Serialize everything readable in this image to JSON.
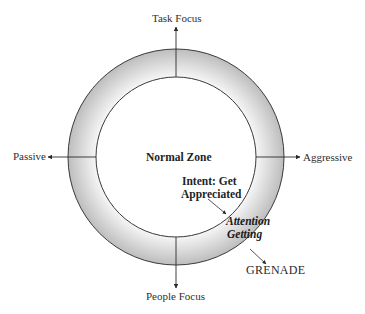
{
  "page": {
    "cropped_header_text": ""
  },
  "diagram": {
    "axes": {
      "top": "Task Focus",
      "bottom": "People Focus",
      "left": "Passive",
      "right": "Aggressive"
    },
    "center_label": "Normal Zone",
    "intent_label_line1": "Intent: Get",
    "intent_label_line2": "Appreciated",
    "ring_label_line1": "Attention",
    "ring_label_line2": "Getting",
    "outcome_label": "GRENADE",
    "colors": {
      "ring_outer": "#b9b9b9",
      "ring_inner": "#f4f4f4",
      "stroke": "#3a3a3a",
      "background": "#ffffff"
    }
  }
}
